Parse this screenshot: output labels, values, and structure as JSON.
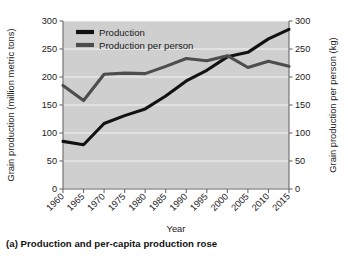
{
  "figure": {
    "caption": "(a) Production and per-capita production rose",
    "plot_bg_color": "#cfcfcf",
    "page_bg_color": "#ffffff",
    "grid_color": "#f2f2f2",
    "axis_color": "#6b6b6b"
  },
  "chart_data": {
    "type": "line",
    "title": "",
    "xlabel": "Year",
    "ylabel": "Grain production (million metric tons)",
    "y2label": "Grain production per person (kg)",
    "categories": [
      1960,
      1965,
      1970,
      1975,
      1980,
      1985,
      1990,
      1995,
      2000,
      2005,
      2010,
      2015
    ],
    "xtick_labels": [
      "1960",
      "1965",
      "1970",
      "1975",
      "1980",
      "1985",
      "1990",
      "1995",
      "2000",
      "2005",
      "2010",
      "2015"
    ],
    "ytick_labels": [
      "0",
      "50",
      "100",
      "150",
      "200",
      "250",
      "300"
    ],
    "y2tick_labels": [
      "0",
      "50",
      "100",
      "150",
      "200",
      "250",
      "300"
    ],
    "ylim": [
      0,
      300
    ],
    "y2lim": [
      0,
      300
    ],
    "grid": true,
    "legend_position": "top-left",
    "series": [
      {
        "name": "Production",
        "color": "#121212",
        "axis": "left",
        "unit": "million metric tons",
        "values": [
          85,
          79,
          117,
          131,
          143,
          166,
          193,
          212,
          236,
          244,
          268,
          285
        ]
      },
      {
        "name": "Production per person",
        "color": "#4d4d4d",
        "axis": "right",
        "unit": "kg",
        "values": [
          185,
          158,
          205,
          207,
          206,
          219,
          233,
          229,
          238,
          217,
          228,
          219
        ]
      }
    ]
  }
}
